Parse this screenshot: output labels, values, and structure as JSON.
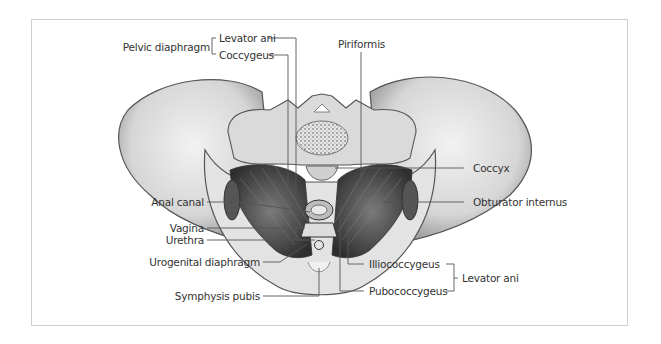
{
  "figure": {
    "labels": {
      "pelvic_diaphragm": "Pelvic diaphragm",
      "levator_ani_top": "Levator ani",
      "coccygeus": "Coccygeus",
      "piriformis": "Piriformis",
      "coccyx": "Coccyx",
      "anal_canal": "Anal canal",
      "obturator_internus": "Obturator internus",
      "vagina": "Vagina",
      "urethra": "Urethra",
      "urogenital_diaphragm": "Urogenital diaphragm",
      "symphysis_pubis": "Symphysis pubis",
      "illiococcygeus": "Illiococcygeus",
      "pubococcygeus": "Pubococcygeus",
      "levator_ani_bottom": "Levator ani"
    },
    "colors": {
      "border": "#cfcfcf",
      "bone": "#d9d9d9",
      "bone_shade": "#a8a8a8",
      "muscle": "#4a4a4a",
      "leader": "#555555",
      "text": "#333333"
    }
  }
}
